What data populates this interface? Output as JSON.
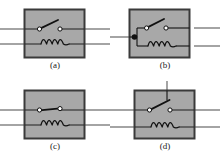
{
  "figure": {
    "panel_count": 4,
    "colors": {
      "page_background": "#ffffff",
      "box_fill": "#a8a8a8",
      "box_border": "#3a3a3a",
      "wire": "#5a5a5a",
      "component": "#1a1a1a",
      "terminal_fill": "#ffffff",
      "junction_fill": "#111111",
      "caption_text": "#1a1a1a"
    },
    "panels": [
      {
        "id": "a",
        "caption": "(a)",
        "box": {
          "fill": "#a8a8a8",
          "border": "#3a3a3a"
        },
        "switch": {
          "name": "switch-open",
          "state": "open",
          "terminals": 2,
          "blade_angle_deg": -22,
          "pivot": "left-terminal"
        },
        "coil": {
          "name": "coil",
          "loops": 3
        },
        "leads": [
          "left-switch-lead",
          "right-switch-lead",
          "left-coil-lead",
          "right-coil-lead"
        ],
        "junction_dots": 0
      },
      {
        "id": "b",
        "caption": "(b)",
        "box": {
          "fill": "#a8a8a8",
          "border": "#3a3a3a"
        },
        "switch": {
          "name": "switch-open",
          "state": "open",
          "terminals": 2,
          "blade_angle_deg": -22,
          "pivot": "left-terminal"
        },
        "coil": {
          "name": "coil",
          "loops": 3
        },
        "leads": [
          "left-common-lead",
          "right-switch-lead",
          "right-coil-lead"
        ],
        "junction_dots": 1,
        "junction_note": "common node joins switch left terminal and coil left end"
      },
      {
        "id": "c",
        "caption": "(c)",
        "box": {
          "fill": "#a8a8a8",
          "border": "#3a3a3a"
        },
        "switch": {
          "name": "switch-closed",
          "state": "closed",
          "terminals": 2,
          "blade_angle_deg": -6,
          "pivot": "left-terminal"
        },
        "coil": {
          "name": "coil",
          "loops": 3
        },
        "leads": [
          "left-switch-lead",
          "right-switch-lead",
          "left-coil-lead",
          "right-coil-lead"
        ],
        "junction_dots": 0
      },
      {
        "id": "d",
        "caption": "(d)",
        "box": {
          "fill": "#a8a8a8",
          "border": "#3a3a3a"
        },
        "switch": {
          "name": "switch-open",
          "state": "open",
          "terminals": 2,
          "blade_angle_deg": -26,
          "pivot": "left-terminal"
        },
        "coil": {
          "name": "coil",
          "loops": 3
        },
        "leads": [
          "top-vertical-lead",
          "left-switch-lead",
          "right-switch-lead",
          "left-coil-lead",
          "right-coil-lead"
        ],
        "junction_dots": 0,
        "junction_note": "vertical lead enters from top edge to switch blade"
      }
    ]
  }
}
